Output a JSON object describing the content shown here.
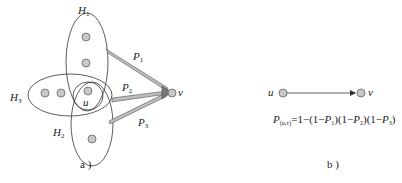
{
  "panel_a": {
    "caption": "a )",
    "hyperedges": [
      {
        "id": "H1",
        "label": "H",
        "sub": "1"
      },
      {
        "id": "H2",
        "label": "H",
        "sub": "2"
      },
      {
        "id": "H3",
        "label": "H",
        "sub": "3"
      }
    ],
    "source_label": "u",
    "target_label": "v",
    "paths": [
      {
        "label": "P",
        "sub": "1"
      },
      {
        "label": "P",
        "sub": "2"
      },
      {
        "label": "P",
        "sub": "3"
      }
    ]
  },
  "panel_b": {
    "caption": "b )",
    "source_label": "u",
    "target_label": "v",
    "formula": {
      "lhs": "P",
      "lhs_sub": "(u,v)",
      "rhs_1": "=1−(1−",
      "p1": "P",
      "p1_sub": "1",
      "rhs_2": ")(1−",
      "p2": "P",
      "p2_sub": "2",
      "rhs_3": ")(1−",
      "p3": "P",
      "p3_sub": "3",
      "rhs_4": ")"
    }
  },
  "colors": {
    "node_fill": "#c8c8c8",
    "node_stroke": "#555555",
    "line": "#333333",
    "arrow_fill": "#bdbdbd"
  }
}
